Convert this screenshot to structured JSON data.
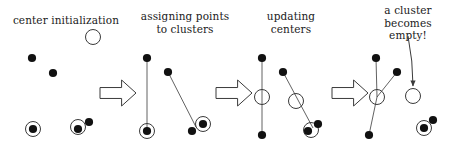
{
  "figure": {
    "background_color": "#ffffff",
    "stroke_color": "#3a3a3a",
    "point_color": "#111111",
    "text_color": "#1a1a1a",
    "width": 449,
    "height": 153
  },
  "captions": {
    "step1": "center initialization",
    "step2": "assigning points\nto clusters",
    "step3": "updating\ncenters",
    "step4": "a cluster\nbecomes\nempty!"
  },
  "arrows": {
    "block_arrow_label": "next step",
    "annotation_arrow_label": "points to empty cluster"
  },
  "panels": [
    {
      "name": "center-initialization",
      "caption_key": "step1",
      "points": [
        {
          "x": 32,
          "y": 58,
          "type": "data-point"
        },
        {
          "x": 53,
          "y": 73,
          "type": "data-point"
        },
        {
          "x": 33,
          "y": 129,
          "type": "data-point"
        },
        {
          "x": 78,
          "y": 129,
          "type": "data-point"
        },
        {
          "x": 89,
          "y": 122,
          "type": "data-point"
        }
      ],
      "centers": [
        {
          "x": 93,
          "y": 37,
          "type": "free-center"
        },
        {
          "x": 33,
          "y": 129,
          "type": "center-on-point"
        },
        {
          "x": 78,
          "y": 127,
          "type": "center-on-point"
        }
      ]
    },
    {
      "name": "assigning-points-to-clusters",
      "caption_key": "step2",
      "points": [
        {
          "x": 147,
          "y": 58,
          "type": "data-point"
        },
        {
          "x": 168,
          "y": 72,
          "type": "data-point"
        },
        {
          "x": 147,
          "y": 131,
          "type": "data-point"
        },
        {
          "x": 192,
          "y": 131,
          "type": "data-point"
        },
        {
          "x": 203,
          "y": 124,
          "type": "data-point"
        }
      ],
      "centers": [
        {
          "x": 147,
          "y": 131,
          "type": "center-on-point"
        },
        {
          "x": 203,
          "y": 124,
          "type": "center-on-point"
        }
      ],
      "assignments": [
        {
          "from": [
            147,
            58
          ],
          "to": [
            147,
            131
          ]
        },
        {
          "from": [
            168,
            72
          ],
          "to": [
            196,
            127
          ]
        }
      ]
    },
    {
      "name": "updating-centers",
      "caption_key": "step3",
      "points": [
        {
          "x": 262,
          "y": 58,
          "type": "data-point"
        },
        {
          "x": 283,
          "y": 72,
          "type": "data-point"
        },
        {
          "x": 262,
          "y": 135,
          "type": "data-point"
        },
        {
          "x": 308,
          "y": 131,
          "type": "data-point"
        },
        {
          "x": 318,
          "y": 124,
          "type": "data-point"
        }
      ],
      "centers": [
        {
          "x": 262,
          "y": 97,
          "type": "free-center"
        },
        {
          "x": 296,
          "y": 101,
          "type": "free-center"
        },
        {
          "x": 311,
          "y": 130,
          "type": "center-on-point"
        }
      ],
      "assignments": [
        {
          "from": [
            262,
            58
          ],
          "to": [
            262,
            135
          ]
        },
        {
          "from": [
            283,
            72
          ],
          "to": [
            313,
            128
          ]
        }
      ]
    },
    {
      "name": "cluster-becomes-empty",
      "caption_key": "step4",
      "points": [
        {
          "x": 376,
          "y": 58,
          "type": "data-point"
        },
        {
          "x": 397,
          "y": 72,
          "type": "data-point"
        },
        {
          "x": 369,
          "y": 135,
          "type": "data-point"
        },
        {
          "x": 424,
          "y": 128,
          "type": "data-point"
        },
        {
          "x": 433,
          "y": 120,
          "type": "data-point"
        }
      ],
      "centers": [
        {
          "x": 377,
          "y": 97,
          "type": "free-center"
        },
        {
          "x": 413,
          "y": 96,
          "type": "empty-center"
        },
        {
          "x": 424,
          "y": 128,
          "type": "center-on-point"
        }
      ],
      "assignments": [
        {
          "from": [
            376,
            58
          ],
          "to": [
            377,
            97
          ]
        },
        {
          "from": [
            397,
            72
          ],
          "to": [
            377,
            97
          ]
        },
        {
          "from": [
            369,
            135
          ],
          "to": [
            377,
            97
          ]
        }
      ]
    }
  ],
  "block_arrows": [
    {
      "x": 100,
      "y": 80,
      "width": 36,
      "height": 26
    },
    {
      "x": 216,
      "y": 80,
      "width": 36,
      "height": 26
    },
    {
      "x": 332,
      "y": 80,
      "width": 36,
      "height": 26
    }
  ],
  "annotation_arrow": {
    "from": [
      408,
      36
    ],
    "to": [
      413,
      86
    ]
  }
}
